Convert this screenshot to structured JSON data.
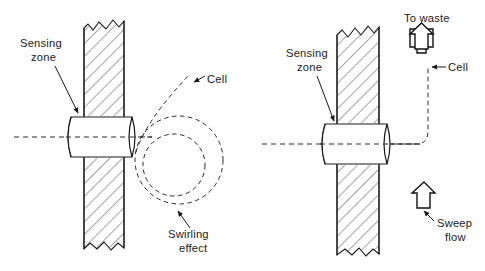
{
  "figure": {
    "type": "technical-line-diagram",
    "background_color": "#ffffff",
    "line_color": "#1a1a1a",
    "dash_color": "#2a2a2a"
  },
  "panels": [
    {
      "id": "left",
      "name": "swirling-effect-panel",
      "labels": {
        "sensing_zone_line1": "Sensing",
        "sensing_zone_line2": "zone",
        "cell": "Cell",
        "swirling_line1": "Swirling",
        "swirling_line2": "effect"
      },
      "elements": {
        "wall": "hatched-vertical-wall-with-break-lines",
        "cylinder": "horizontal-barrel-sensing-zone",
        "centerline": "horizontal-dashed-axis",
        "cell_path": "dashed-diagonal-entering-path",
        "swirl": "two-nested-dashed-circles-spiral"
      }
    },
    {
      "id": "right",
      "name": "sweep-flow-panel",
      "labels": {
        "sensing_zone_line1": "Sensing",
        "sensing_zone_line2": "zone",
        "cell": "Cell",
        "to_waste": "To waste",
        "sweep_line1": "Sweep",
        "sweep_line2": "flow"
      },
      "elements": {
        "wall": "hatched-vertical-wall-with-break-lines",
        "cylinder": "horizontal-barrel-sensing-zone",
        "centerline": "horizontal-dashed-axis",
        "cell_path": "dashed-path-bending-upward",
        "to_waste_arrow": "hollow-up-arrow",
        "sweep_flow_arrow": "hollow-up-arrow"
      }
    }
  ]
}
